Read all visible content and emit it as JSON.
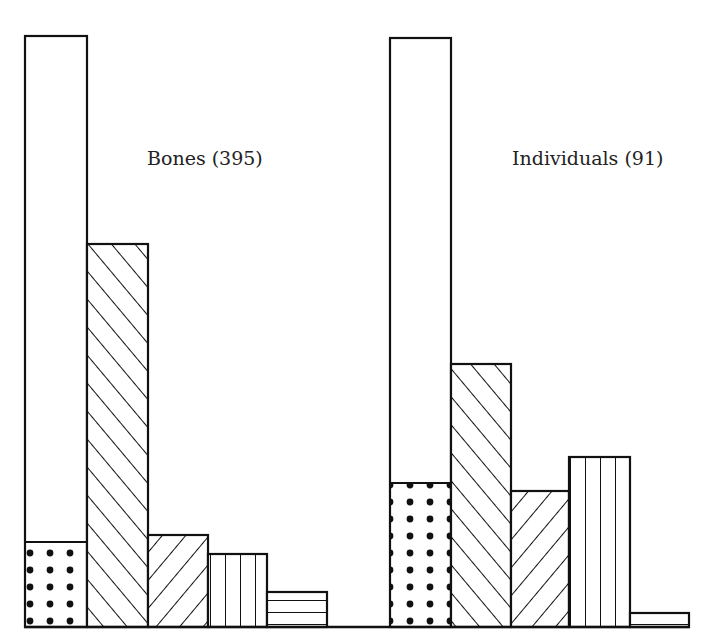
{
  "chart_data": {
    "type": "bar",
    "title": "",
    "xlabel": "",
    "ylabel": "",
    "grid": false,
    "legend": null,
    "value_units": "relative bar height (no axis scale shown)",
    "groups": [
      {
        "label": "Bones (395)",
        "name": "Bones",
        "n": 395,
        "bars": [
          {
            "pattern": "plain-with-dotted-base",
            "value": 591,
            "dotted_portion": 85
          },
          {
            "pattern": "diagonal-forward",
            "value": 383
          },
          {
            "pattern": "diagonal-backward",
            "value": 92
          },
          {
            "pattern": "vertical-lines",
            "value": 73
          },
          {
            "pattern": "horizontal-lines",
            "value": 35
          }
        ]
      },
      {
        "label": "Individuals (91)",
        "name": "Individuals",
        "n": 91,
        "bars": [
          {
            "pattern": "plain-with-dotted-base",
            "value": 589,
            "dotted_portion": 144
          },
          {
            "pattern": "diagonal-forward",
            "value": 263
          },
          {
            "pattern": "diagonal-backward",
            "value": 136
          },
          {
            "pattern": "vertical-lines",
            "value": 170
          },
          {
            "pattern": "horizontal-lines",
            "value": 14
          }
        ]
      }
    ]
  },
  "labels": {
    "bones": "Bones (395)",
    "individuals": "Individuals (91)"
  },
  "colors": {
    "ink": "#111111",
    "paper": "#ffffff"
  }
}
